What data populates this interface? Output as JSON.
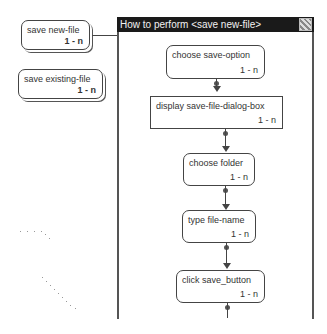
{
  "left_tasks": [
    {
      "label": "save new-file",
      "multiplicity": "1 - n"
    },
    {
      "label": "save existing-file",
      "multiplicity": "1 - n"
    }
  ],
  "window": {
    "title": "How to perform <save new-file>",
    "close_icon": "close-icon"
  },
  "steps": [
    {
      "label": "choose save-option",
      "multiplicity": "1 - n",
      "shape": "rounded"
    },
    {
      "label": "display save-file-dialog-box",
      "multiplicity": "1 - n",
      "shape": "rect"
    },
    {
      "label": "choose folder",
      "multiplicity": "1 - n",
      "shape": "rounded"
    },
    {
      "label": "type file-name",
      "multiplicity": "1 - n",
      "shape": "rounded"
    },
    {
      "label": "click save_button",
      "multiplicity": "1 - n",
      "shape": "rounded"
    }
  ]
}
